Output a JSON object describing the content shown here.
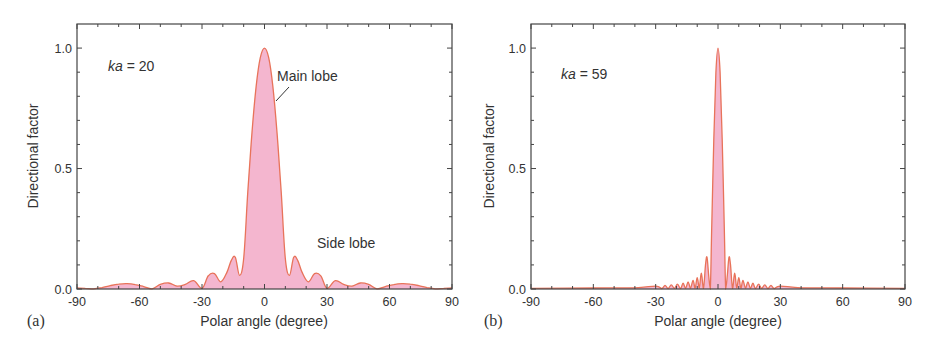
{
  "figure": {
    "colors": {
      "fill": "#F4B6CF",
      "line": "#E8735A",
      "axis": "#444444",
      "text": "#333333"
    }
  },
  "chart_data": [
    {
      "type": "area",
      "panel_label": "(a)",
      "title": "",
      "annotation_param": "ka = 20",
      "annotation_param_italic": "ka",
      "annotation_param_value": " = 20",
      "annotations": [
        {
          "text": "Main lobe",
          "x_deg": 8,
          "y": 0.88,
          "leader_from": [
            8.5,
            0.83
          ],
          "leader_to": [
            5.5,
            0.75
          ]
        },
        {
          "text": "Side lobe",
          "x_deg": 20,
          "y": 0.15
        }
      ],
      "xlabel": "Polar angle (degree)",
      "ylabel": "Directional factor",
      "xlim": [
        -90,
        90
      ],
      "ylim": [
        0,
        1.1
      ],
      "xticks": [
        -90,
        -60,
        -30,
        0,
        30,
        60,
        90
      ],
      "xtick_labels": [
        "-90",
        "-60",
        "-30",
        "0",
        "30",
        "60",
        "90"
      ],
      "yticks": [
        0.0,
        0.5,
        1.0
      ],
      "ytick_labels": [
        "0.0",
        "0.5",
        "1.0"
      ],
      "grid": false,
      "legend": null,
      "model": "|2·J1(ka·sinθ)/(ka·sinθ)|, ka = 20",
      "x": [
        -90,
        -86,
        -82,
        -78,
        -74,
        -70,
        -66,
        -62,
        -58,
        -54,
        -50,
        -46,
        -42,
        -38,
        -34,
        -30,
        -27,
        -24,
        -21,
        -18,
        -16,
        -14,
        -12,
        -10,
        -8,
        -6,
        -4,
        -2,
        0,
        2,
        4,
        6,
        8,
        10,
        12,
        14,
        16,
        18,
        21,
        24,
        27,
        30,
        34,
        38,
        42,
        46,
        50,
        54,
        58,
        62,
        66,
        70,
        74,
        78,
        82,
        86,
        90
      ],
      "values": [
        0.004,
        0.003,
        0.001,
        0.006,
        0.014,
        0.02,
        0.022,
        0.018,
        0.01,
        0.001,
        0.019,
        0.025,
        0.012,
        0.019,
        0.035,
        0.003,
        0.055,
        0.064,
        0.03,
        0.07,
        0.118,
        0.132,
        0.057,
        0.128,
        0.403,
        0.65,
        0.843,
        0.96,
        1.0,
        0.96,
        0.843,
        0.65,
        0.403,
        0.128,
        0.057,
        0.132,
        0.118,
        0.07,
        0.03,
        0.064,
        0.055,
        0.003,
        0.035,
        0.019,
        0.012,
        0.025,
        0.019,
        0.001,
        0.01,
        0.018,
        0.022,
        0.02,
        0.014,
        0.006,
        0.001,
        0.003,
        0.004
      ]
    },
    {
      "type": "area",
      "panel_label": "(b)",
      "title": "",
      "annotation_param": "ka = 59",
      "annotation_param_italic": "ka",
      "annotation_param_value": " = 59",
      "annotations": [],
      "xlabel": "Polar angle (degree)",
      "ylabel": "Directional factor",
      "xlim": [
        -90,
        90
      ],
      "ylim": [
        0,
        1.1
      ],
      "xticks": [
        -90,
        -60,
        -30,
        0,
        30,
        60,
        90
      ],
      "xtick_labels": [
        "-90",
        "-60",
        "-30",
        "0",
        "30",
        "60",
        "90"
      ],
      "yticks": [
        0.0,
        0.5,
        1.0
      ],
      "ytick_labels": [
        "0.0",
        "0.5",
        "1.0"
      ],
      "grid": false,
      "legend": null,
      "model": "|2·J1(ka·sinθ)/(ka·sinθ)|, ka = 59",
      "x": [
        -90,
        -60,
        -40,
        -30,
        -27,
        -25.5,
        -24,
        -22.5,
        -21,
        -19.5,
        -18,
        -16.8,
        -15.6,
        -14.4,
        -13.2,
        -12,
        -11,
        -10,
        -9,
        -8,
        -7,
        -6,
        -5.3,
        -4.5,
        -3.7,
        -3,
        -2,
        -1,
        0,
        1,
        2,
        3,
        3.7,
        4.5,
        5.3,
        6,
        7,
        8,
        9,
        10,
        11,
        12,
        13.2,
        14.4,
        15.6,
        16.8,
        18,
        19.5,
        21,
        22.5,
        24,
        25.5,
        27,
        30,
        40,
        60,
        90
      ],
      "values": [
        0.003,
        0.004,
        0.005,
        0.012,
        0.002,
        0.015,
        0.002,
        0.017,
        0.003,
        0.02,
        0.002,
        0.024,
        0.003,
        0.029,
        0.004,
        0.036,
        0.004,
        0.047,
        0.005,
        0.066,
        0.003,
        0.101,
        0.132,
        0.06,
        0.0,
        0.27,
        0.62,
        0.9,
        1.0,
        0.9,
        0.62,
        0.27,
        0.0,
        0.06,
        0.132,
        0.101,
        0.003,
        0.066,
        0.005,
        0.047,
        0.004,
        0.036,
        0.004,
        0.029,
        0.003,
        0.024,
        0.002,
        0.02,
        0.003,
        0.017,
        0.002,
        0.015,
        0.002,
        0.012,
        0.005,
        0.004,
        0.003
      ]
    }
  ],
  "panels": [
    {
      "id": "a",
      "frame": {
        "left": 77,
        "right": 452,
        "top": 24,
        "bottom": 289
      },
      "panel_label_pos": [
        27,
        326
      ],
      "ylabel_pos": [
        38,
        156
      ],
      "xlabel_pos": [
        264,
        326
      ],
      "param_pos": [
        108,
        71
      ],
      "main_lobe_label_pos": [
        277,
        81
      ],
      "main_lobe_leader": [
        [
          289,
          87
        ],
        [
          276,
          101
        ]
      ],
      "side_lobe_label_pos": [
        317,
        248
      ]
    },
    {
      "id": "b",
      "frame": {
        "left": 531,
        "right": 905,
        "top": 24,
        "bottom": 289
      },
      "panel_label_pos": [
        484,
        326
      ],
      "ylabel_pos": [
        494,
        156
      ],
      "xlabel_pos": [
        718,
        326
      ],
      "param_pos": [
        561,
        79
      ]
    }
  ]
}
